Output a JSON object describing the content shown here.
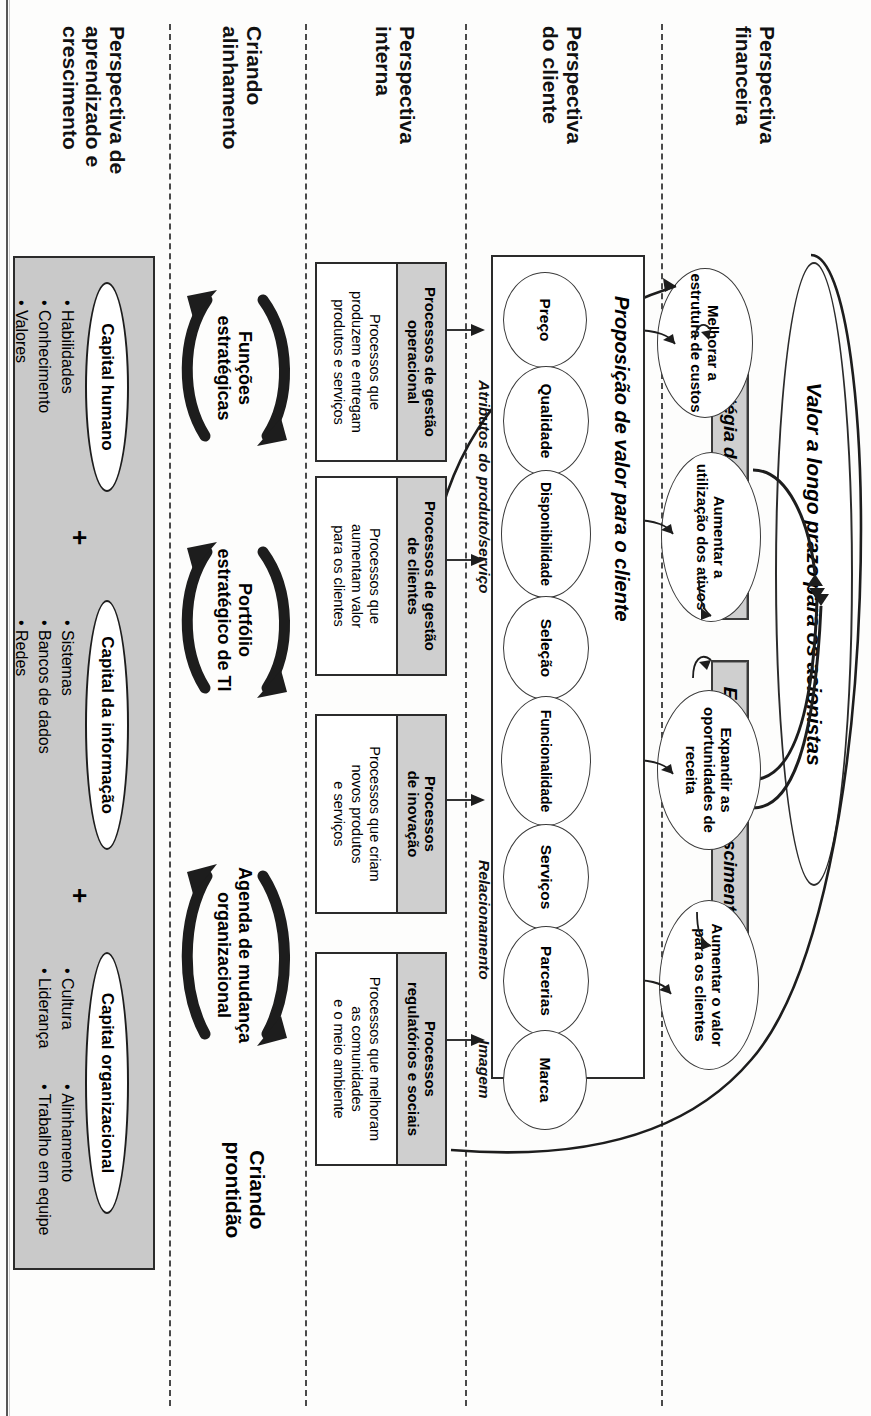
{
  "diagram": {
    "top_headings": {
      "readiness": "Criando\nprontidão"
    },
    "perspectives": [
      {
        "id": "financeira",
        "label": "Perspectiva\nfinanceira"
      },
      {
        "id": "cliente",
        "label": "Perspectiva\ndo cliente"
      },
      {
        "id": "interna",
        "label": "Perspectiva\ninterna"
      },
      {
        "id": "alinhamento",
        "label": "Criando\nalinhamento"
      },
      {
        "id": "aprendizado",
        "label": "Perspectiva de\naprendizado e\ncrescimento"
      }
    ],
    "financial": {
      "shareholder_value": "Valor a longo prazo para os acionistas",
      "strategies": [
        {
          "id": "produtividade",
          "label": "Estratégia de produtividade"
        },
        {
          "id": "crescimento",
          "label": "Estratégia de crescimento"
        }
      ],
      "objectives": [
        {
          "id": "melhorar-custos",
          "label": "Melhorar a\nestrutura de custos"
        },
        {
          "id": "aumentar-ativos",
          "label": "Aumentar a\nutilização dos ativos"
        },
        {
          "id": "expandir-receita",
          "label": "Expandir as\noportunidades de\nreceita"
        },
        {
          "id": "aumentar-valor-clientes",
          "label": "Aumentar o valor\npara os clientes"
        }
      ]
    },
    "customer": {
      "title": "Proposição de valor para o cliente",
      "attributes": [
        {
          "id": "preco",
          "label": "Preço"
        },
        {
          "id": "qualidade",
          "label": "Qualidade"
        },
        {
          "id": "disponibilidade",
          "label": "Disponibilidade"
        },
        {
          "id": "selecao",
          "label": "Seleção"
        },
        {
          "id": "funcionalidade",
          "label": "Funcionalidade"
        },
        {
          "id": "servicos",
          "label": "Serviços"
        },
        {
          "id": "parcerias",
          "label": "Parcerias"
        },
        {
          "id": "marca",
          "label": "Marca"
        }
      ],
      "groups": [
        {
          "id": "atributos",
          "label": "Atributos do produto/serviço"
        },
        {
          "id": "relacionamento",
          "label": "Relacionamento"
        },
        {
          "id": "imagem",
          "label": "Imagem"
        }
      ]
    },
    "internal": {
      "processes": [
        {
          "id": "operacional",
          "header": "Processos de gestão\noperacional",
          "body": "Processos que\nproduzem e entregam\nprodutos e serviços"
        },
        {
          "id": "clientes",
          "header": "Processos de gestão\nde clientes",
          "body": "Processos que\naumentam valor\npara os clientes"
        },
        {
          "id": "inovacao",
          "header": "Processos\nde inovação",
          "body": "Processos que criam\nnovos produtos\ne serviços"
        },
        {
          "id": "regulatorios",
          "header": "Processos\nregulatórios e sociais",
          "body": "Processos que melhoram\nas comunidades\ne o meio ambiente"
        }
      ]
    },
    "alignment": {
      "links": [
        {
          "id": "funcoes",
          "label": "Funções\nestratégicas"
        },
        {
          "id": "portfolio",
          "label": "Portfólio\nestratégico de TI"
        },
        {
          "id": "agenda",
          "label": "Agenda de mudança\norganizacional"
        }
      ]
    },
    "learning": {
      "plus_sign": "+",
      "capitals": [
        {
          "id": "humano",
          "label": "Capital humano",
          "bullets": [
            "• Habilidades",
            "• Conhecimento",
            "• Valores"
          ]
        },
        {
          "id": "informacao",
          "label": "Capital da informação",
          "bullets": [
            "• Sistemas",
            "• Bancos de dados",
            "• Redes"
          ]
        },
        {
          "id": "organizacional",
          "label": "Capital organizacional",
          "bullets_col1": [
            "• Cultura",
            "• Liderança"
          ],
          "bullets_col2": [
            "• Alinhamento",
            "• Trabalho em equipe"
          ]
        }
      ]
    },
    "colors": {
      "strategy_box_fill": "#cfcfcf",
      "process_header_fill": "#cfcfcf",
      "learning_panel_fill": "#c9c9c9",
      "line": "#1d1d1d",
      "page": "#fdfdfc"
    }
  }
}
